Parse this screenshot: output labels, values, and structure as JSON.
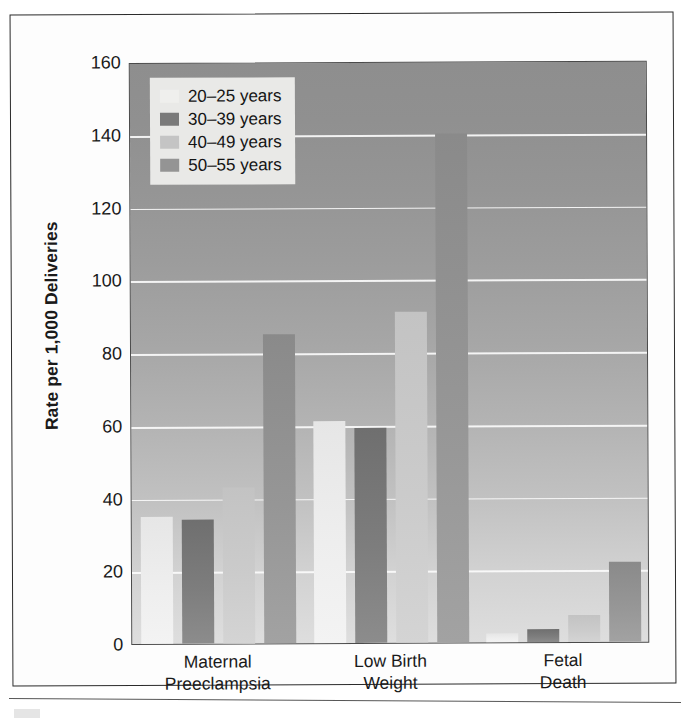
{
  "chart_data": {
    "type": "bar",
    "title": "",
    "subtitle": "",
    "xlabel": "",
    "ylabel": "Rate per 1,000 Deliveries",
    "ylim": [
      0,
      160
    ],
    "ytick_step": 20,
    "yticks": [
      160,
      140,
      120,
      100,
      80,
      60,
      40,
      20,
      0
    ],
    "ytick_labels": [
      "160",
      "140",
      "120",
      "100",
      "80",
      "60",
      "40",
      "20",
      "0"
    ],
    "grid": true,
    "grid_orientation": "horizontal",
    "legend_position": "top-left-inside",
    "categories": [
      "Maternal\nPreeclampsia",
      "Low Birth\nWeight",
      "Fetal Death"
    ],
    "category_labels_flat": [
      "Maternal Preeclampsia",
      "Low Birth Weight",
      "Fetal Death"
    ],
    "series": [
      {
        "name": "20–25 years",
        "color": "#efefed",
        "values": [
          35,
          61,
          2.5
        ]
      },
      {
        "name": "30–39 years",
        "color": "#7a7a7a",
        "values": [
          34,
          59,
          3.5
        ]
      },
      {
        "name": "40–49 years",
        "color": "#c4c4c4",
        "values": [
          43,
          91,
          7.5
        ]
      },
      {
        "name": "50–55 years",
        "color": "#949494",
        "values": [
          85,
          140,
          22
        ]
      }
    ]
  },
  "legend": {
    "items": [
      {
        "label": "20–25 years"
      },
      {
        "label": "30–39 years"
      },
      {
        "label": "40–49 years"
      },
      {
        "label": "50–55 years"
      }
    ]
  },
  "axes": {
    "y_title": "Rate per 1,000 Deliveries"
  },
  "colors": {
    "plot_bg_top": "#8e8e8e",
    "plot_bg_bottom": "#dedede",
    "gridline": "#fbfbfb",
    "frame": "#2b2b2b",
    "text": "#1a1a1a",
    "legend_bg": "#e9e9e7"
  }
}
